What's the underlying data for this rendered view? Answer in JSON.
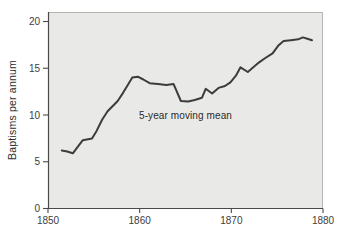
{
  "chart_data": {
    "type": "line",
    "title": "",
    "xlabel": "",
    "ylabel": "Baptisms per annum",
    "annotation": "5-year moving mean",
    "x_ticks": [
      "1850",
      "1860",
      "1870",
      "1880"
    ],
    "x_tick_values": [
      1850,
      1860,
      1870,
      1880
    ],
    "y_ticks": [
      "0",
      "5",
      "10",
      "15",
      "20"
    ],
    "y_tick_values": [
      0,
      5,
      10,
      15,
      20
    ],
    "xlim": [
      1850,
      1880
    ],
    "ylim": [
      0,
      21
    ],
    "grid": false,
    "legend_position": "none",
    "series": [
      {
        "name": "5-year moving mean",
        "points": [
          [
            1851.5,
            6.2
          ],
          [
            1852.1,
            6.1
          ],
          [
            1852.7,
            5.9
          ],
          [
            1853.8,
            7.3
          ],
          [
            1854.8,
            7.5
          ],
          [
            1855.3,
            8.3
          ],
          [
            1855.9,
            9.5
          ],
          [
            1856.5,
            10.4
          ],
          [
            1857.6,
            11.5
          ],
          [
            1858.2,
            12.4
          ],
          [
            1858.7,
            13.2
          ],
          [
            1859.2,
            14.0
          ],
          [
            1859.8,
            14.1
          ],
          [
            1860.4,
            13.8
          ],
          [
            1861.1,
            13.4
          ],
          [
            1862.0,
            13.3
          ],
          [
            1862.9,
            13.2
          ],
          [
            1863.7,
            13.3
          ],
          [
            1864.5,
            11.5
          ],
          [
            1865.3,
            11.45
          ],
          [
            1866.0,
            11.6
          ],
          [
            1866.8,
            11.85
          ],
          [
            1867.2,
            12.8
          ],
          [
            1867.9,
            12.3
          ],
          [
            1868.6,
            12.9
          ],
          [
            1869.3,
            13.1
          ],
          [
            1869.9,
            13.5
          ],
          [
            1870.5,
            14.2
          ],
          [
            1871.0,
            15.1
          ],
          [
            1871.8,
            14.6
          ],
          [
            1872.4,
            15.1
          ],
          [
            1873.0,
            15.6
          ],
          [
            1873.7,
            16.1
          ],
          [
            1874.5,
            16.6
          ],
          [
            1875.1,
            17.4
          ],
          [
            1875.7,
            17.9
          ],
          [
            1876.5,
            18.0
          ],
          [
            1877.3,
            18.1
          ],
          [
            1877.8,
            18.3
          ],
          [
            1878.3,
            18.15
          ],
          [
            1878.8,
            18.0
          ]
        ]
      }
    ],
    "colors": {
      "line": "#3c3c3c",
      "plot_background": "#e9e9e7",
      "page_background": "#ffffff",
      "axis": "#4a4a4a",
      "panel_border": "#b5b5b2"
    }
  }
}
